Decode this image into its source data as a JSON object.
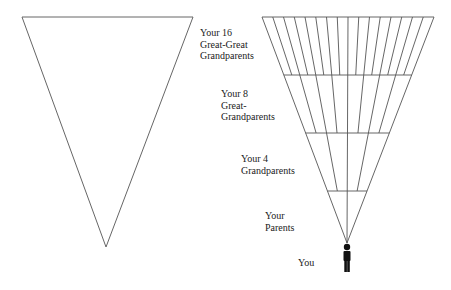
{
  "diagram": {
    "left_triangle": {
      "name": "empty-inverted-triangle"
    },
    "right_triangle": {
      "name": "ancestry-fan-triangle"
    },
    "labels": {
      "great_great": "Your 16\nGreat-Great\nGrandparents",
      "great": "Your 8\nGreat-\nGrandparents",
      "grandparents": "Your 4\nGrandparents",
      "parents": "Your\nParents",
      "you": "You"
    },
    "generations": [
      {
        "label": "Your 16 Great-Great Grandparents",
        "count": 16
      },
      {
        "label": "Your 8 Great-Grandparents",
        "count": 8
      },
      {
        "label": "Your 4 Grandparents",
        "count": 4
      },
      {
        "label": "Your Parents",
        "count": 2
      },
      {
        "label": "You",
        "count": 1
      }
    ],
    "line_color": "#555555",
    "icon_color": "#111111"
  }
}
